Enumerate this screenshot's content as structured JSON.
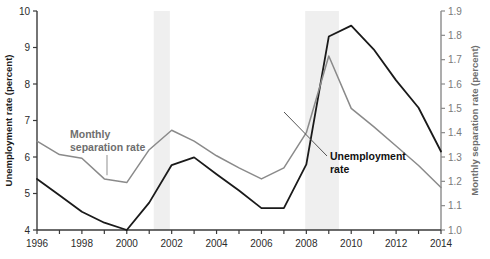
{
  "chart_data": {
    "type": "line",
    "title": "",
    "xlabel": "",
    "ylabel": "Unemployment rate (percent)",
    "y2label": "Monthly separation rate (percent)",
    "x": [
      1996,
      1997,
      1998,
      1999,
      2000,
      2001,
      2002,
      2003,
      2004,
      2005,
      2006,
      2007,
      2008,
      2009,
      2010,
      2011,
      2012,
      2013,
      2014
    ],
    "xlim": [
      1996,
      2014
    ],
    "ylim": [
      4,
      10
    ],
    "y2lim": [
      1.0,
      1.9
    ],
    "xticks": [
      1996,
      1997,
      1998,
      1999,
      2000,
      2001,
      2002,
      2003,
      2004,
      2005,
      2006,
      2007,
      2008,
      2009,
      2010,
      2011,
      2012,
      2013,
      2014
    ],
    "xticklabels": [
      "1996",
      "",
      "1998",
      "",
      "2000",
      "",
      "2002",
      "",
      "2004",
      "",
      "2006",
      "",
      "2008",
      "",
      "2010",
      "",
      "2012",
      "",
      "2014"
    ],
    "yticks": [
      4,
      5,
      6,
      7,
      8,
      9,
      10
    ],
    "yticklabels": [
      "4",
      "5",
      "6",
      "7",
      "8",
      "9",
      "10"
    ],
    "y2ticks": [
      1.0,
      1.1,
      1.2,
      1.3,
      1.4,
      1.5,
      1.6,
      1.7,
      1.8,
      1.9
    ],
    "y2ticklabels": [
      "1.0",
      "1.1",
      "1.2",
      "1.3",
      "1.4",
      "1.5",
      "1.6",
      "1.7",
      "1.8",
      "1.9"
    ],
    "grid": false,
    "legend": "annotations",
    "series": [
      {
        "name": "Unemployment rate",
        "axis": "left",
        "color": "#1a1a1a",
        "values": [
          5.4,
          4.95,
          4.5,
          4.2,
          4.0,
          4.75,
          5.78,
          5.99,
          5.53,
          5.08,
          4.6,
          4.6,
          5.8,
          9.3,
          9.6,
          8.95,
          8.1,
          7.35,
          6.15
        ]
      },
      {
        "name": "Monthly separation rate",
        "axis": "right",
        "color": "#8a8a8a",
        "values": [
          1.365,
          1.31,
          1.295,
          1.21,
          1.195,
          1.33,
          1.41,
          1.365,
          1.305,
          1.255,
          1.21,
          1.255,
          1.4,
          1.715,
          1.5,
          1.425,
          1.345,
          1.265,
          1.175
        ]
      }
    ],
    "shaded_regions": [
      {
        "name": "recession-2001",
        "x0": 2001.2,
        "x1": 2001.92
      },
      {
        "name": "recession-2008",
        "x0": 2007.95,
        "x1": 2009.45
      }
    ],
    "shade_color": "#efefef",
    "annotations": [
      {
        "name": "monthly-separation-rate-annotation",
        "line1": "Monthly",
        "line2": "separation rate",
        "color": "#6e6e6e"
      },
      {
        "name": "unemployment-rate-annotation",
        "line1": "Unemployment",
        "line2": "rate",
        "color": "#111111"
      }
    ]
  }
}
